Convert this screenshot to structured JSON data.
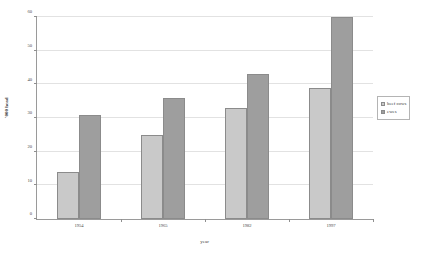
{
  "chart_data": {
    "type": "bar",
    "title": "",
    "xlabel": "year",
    "ylabel": "'000 head",
    "categories": [
      "1954",
      "1965",
      "1982",
      "1997"
    ],
    "series": [
      {
        "name": "beef cows",
        "color": "#c9c9c9",
        "values": [
          14,
          25,
          33,
          39
        ]
      },
      {
        "name": "ewes",
        "color": "#9e9e9e",
        "values": [
          31,
          36,
          43,
          60
        ]
      }
    ],
    "ylim": [
      0,
      60
    ],
    "yticks": [
      0,
      10,
      20,
      30,
      40,
      50,
      60
    ],
    "ytick_labels": [
      "0",
      "10",
      "20",
      "30",
      "40",
      "50",
      "60"
    ],
    "grid": true,
    "grid_axis": "y",
    "legend_position": "right"
  },
  "legend": {
    "entries": [
      {
        "label": "beef cows"
      },
      {
        "label": "ewes"
      }
    ]
  },
  "axes": {
    "x_title": "year",
    "y_title": "'000 head"
  }
}
